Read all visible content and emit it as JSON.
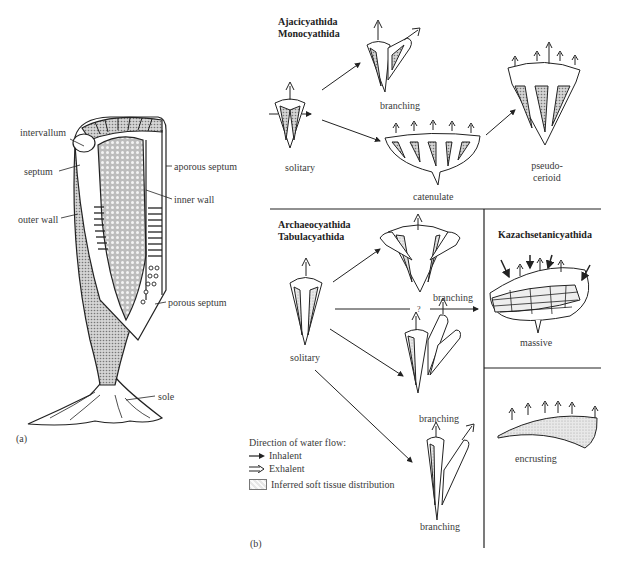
{
  "panel_a": {
    "tag": "(a)",
    "labels": {
      "intervallum": "intervallum",
      "septum": "septum",
      "outer_wall": "outer wall",
      "aporous_septum": "aporous septum",
      "inner_wall": "inner wall",
      "porous_septum": "porous septum",
      "sole": "sole"
    }
  },
  "panel_b": {
    "tag": "(b)",
    "group1": {
      "title_line1": "Ajacicyathida",
      "title_line2": "Monocyathida",
      "forms": {
        "solitary": "solitary",
        "branching": "branching",
        "catenulate": "catenulate",
        "pseudocerioid_line1": "pseudo-",
        "pseudocerioid_line2": "cerioid"
      }
    },
    "group2": {
      "title_line1": "Archaeocyathida",
      "title_line2": "Tabulacyathida",
      "forms": {
        "solitary": "solitary",
        "branching_1": "branching",
        "branching_2": "branching",
        "branching_3": "branching",
        "uncertain": "?"
      }
    },
    "group3": {
      "title": "Kazachsetanicyathida",
      "forms": {
        "massive": "massive",
        "encrusting": "encrusting"
      }
    },
    "legend": {
      "heading": "Direction of water flow:",
      "inhalent": "Inhalent",
      "exhalent": "Exhalent",
      "soft_tissue": "Inferred soft tissue distribution",
      "icons": [
        "inhalent-arrow-icon",
        "exhalent-arrow-icon",
        "soft-tissue-swatch"
      ]
    }
  },
  "colors": {
    "ink": "#333333",
    "stipple": "#9a9a9a",
    "background": "#ffffff"
  }
}
